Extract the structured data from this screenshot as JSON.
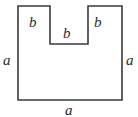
{
  "figure": {
    "type": "geometry-diagram",
    "canvas": {
      "width": 138,
      "height": 117
    },
    "background_color": "#ffffff",
    "stroke_color": "#3a3a3a",
    "stroke_width": 1.6,
    "fill_color": "#ffffff",
    "outline_points": "18,6 50,6 50,44 88,44 88,6 122,6 122,100 18,100",
    "vertices": [
      {
        "name": "top-left",
        "x": 18,
        "y": 6
      },
      {
        "name": "notch-top-left",
        "x": 50,
        "y": 6
      },
      {
        "name": "notch-bottom-left",
        "x": 50,
        "y": 44
      },
      {
        "name": "notch-bottom-right",
        "x": 88,
        "y": 44
      },
      {
        "name": "notch-top-right",
        "x": 88,
        "y": 6
      },
      {
        "name": "top-right",
        "x": 122,
        "y": 6
      },
      {
        "name": "bottom-right",
        "x": 122,
        "y": 100
      },
      {
        "name": "bottom-left",
        "x": 18,
        "y": 100
      }
    ],
    "labels": {
      "side_a_left": "a",
      "side_a_right": "a",
      "side_a_bottom": "a",
      "notch_b_left": "b",
      "notch_b_middle": "b",
      "notch_b_right": "b"
    },
    "label_text_color": "#2b2b2b"
  }
}
